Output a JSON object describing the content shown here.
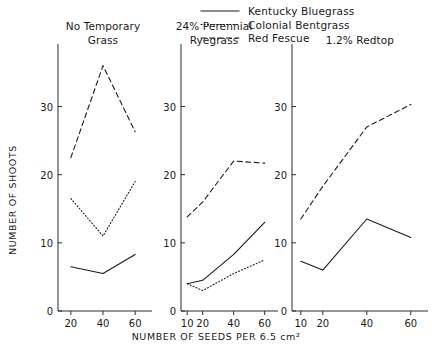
{
  "chart_data": {
    "type": "line",
    "title": "",
    "xlabel": "NUMBER OF SEEDS PER 6.5 cm²",
    "ylabel": "NUMBER OF SHOOTS",
    "ylim": [
      0,
      38
    ],
    "yticks": [
      0,
      10,
      20,
      30
    ],
    "ytick_labels": [
      "0",
      "10",
      "20",
      "30"
    ],
    "grid": false,
    "legend_position": "top-right",
    "legend": [
      {
        "name": "Kentucky Bluegrass",
        "style": "solid"
      },
      {
        "name": "Colonial Bentgrass",
        "style": "dotted"
      },
      {
        "name": "Red Fescue",
        "style": "dashed"
      }
    ],
    "panels": [
      {
        "title_lines": [
          "No Temporary",
          "Grass"
        ],
        "title": "No Temporary Grass",
        "x": [
          20,
          40,
          60
        ],
        "xtick_labels": [
          "20",
          "40",
          "60"
        ],
        "xlim": [
          12,
          68
        ],
        "series": [
          {
            "name": "Kentucky Bluegrass",
            "style": "solid",
            "values": [
              6.5,
              5.5,
              8.3
            ]
          },
          {
            "name": "Colonial Bentgrass",
            "style": "dotted",
            "values": [
              16.5,
              11.0,
              19.0
            ]
          },
          {
            "name": "Red Fescue",
            "style": "dashed",
            "values": [
              22.5,
              36.0,
              26.3
            ]
          }
        ]
      },
      {
        "title_lines": [
          "24% Perennial",
          "Ryegrass"
        ],
        "title": "24% Perennial Ryegrass",
        "x": [
          10,
          20,
          40,
          60
        ],
        "xtick_labels": [
          "10",
          "20",
          "40",
          "60"
        ],
        "xlim": [
          6,
          66
        ],
        "series": [
          {
            "name": "Kentucky Bluegrass",
            "style": "solid",
            "values": [
              4.0,
              4.5,
              8.3,
              13.0
            ]
          },
          {
            "name": "Colonial Bentgrass",
            "style": "dotted",
            "values": [
              4.0,
              3.0,
              5.5,
              7.5
            ]
          },
          {
            "name": "Red Fescue",
            "style": "dashed",
            "values": [
              13.8,
              16.0,
              22.0,
              21.7
            ]
          }
        ]
      },
      {
        "title_lines": [
          "1.2% Redtop"
        ],
        "title": "1.2% Redtop",
        "x": [
          10,
          20,
          40,
          60
        ],
        "xtick_labels": [
          "10",
          "20",
          "40",
          "60"
        ],
        "xlim": [
          6,
          66
        ],
        "series": [
          {
            "name": "Kentucky Bluegrass",
            "style": "solid",
            "values": [
              7.3,
              6.0,
              13.5,
              10.8
            ]
          },
          {
            "name": "Red Fescue",
            "style": "dashed",
            "values": [
              13.5,
              18.3,
              27.0,
              30.3
            ]
          }
        ]
      }
    ]
  }
}
